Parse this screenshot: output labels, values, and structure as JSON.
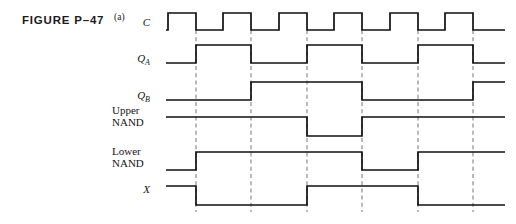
{
  "figure": {
    "caption": "FIGURE P–47",
    "part_label": "(a)"
  },
  "canvas": {
    "width": 516,
    "height": 224,
    "background": "#ffffff",
    "wave_color": "#101010",
    "guide_color": "#8d8d8d",
    "text_color": "#151515"
  },
  "timing": {
    "x_start": 166,
    "x_end": 505,
    "unit": 27.8,
    "guide_x": [
      196,
      251,
      307,
      362,
      418,
      473
    ],
    "clock_period_px": 55.6,
    "signal_count": 6
  },
  "signals": [
    {
      "name": "clock",
      "label": "C",
      "label_style": "italic",
      "subscript": "",
      "label_x": 150,
      "label_y": 26,
      "label_anchor": "end",
      "y_high": 13,
      "y_low": 30,
      "lead_in_x": 166,
      "transitions": [
        168,
        196,
        223,
        251,
        279,
        307,
        334,
        362,
        390,
        418,
        445,
        473
      ],
      "start_level": "low",
      "end_x": 505
    },
    {
      "name": "q-a",
      "label": "Q",
      "label_style": "italic",
      "subscript": "A",
      "label_x": 150,
      "label_y": 62,
      "label_anchor": "end",
      "y_high": 45,
      "y_low": 63,
      "lead_in_x": 166,
      "transitions": [
        196,
        251,
        307,
        362,
        418,
        473
      ],
      "start_level": "low",
      "end_x": 505
    },
    {
      "name": "q-b",
      "label": "Q",
      "label_style": "italic",
      "subscript": "B",
      "label_x": 150,
      "label_y": 99,
      "label_anchor": "end",
      "y_high": 82,
      "y_low": 100,
      "lead_in_x": 166,
      "transitions": [
        251,
        362,
        473
      ],
      "start_level": "low",
      "end_x": 505
    },
    {
      "name": "upper-nand",
      "label": "Upper",
      "label2": "NAND",
      "label_style": "roman",
      "subscript": "",
      "label_x": 112,
      "label_y": 114,
      "label2_y": 126,
      "label_anchor": "start",
      "y_high": 117,
      "y_low": 136,
      "lead_in_x": 166,
      "transitions": [
        307,
        362
      ],
      "start_level": "high",
      "end_x": 505
    },
    {
      "name": "lower-nand",
      "label": "Lower",
      "label2": "NAND",
      "label_style": "roman",
      "subscript": "",
      "label_x": 112,
      "label_y": 155,
      "label2_y": 167,
      "label_anchor": "start",
      "y_high": 152,
      "y_low": 170,
      "lead_in_x": 166,
      "transitions": [
        196,
        362,
        418
      ],
      "start_level": "low",
      "end_x": 505
    },
    {
      "name": "x-output",
      "label": "X",
      "label_style": "italic",
      "subscript": "",
      "label_x": 150,
      "label_y": 193,
      "label_anchor": "end",
      "y_high": 186,
      "y_low": 205,
      "lead_in_x": 166,
      "transitions": [
        196,
        307,
        418
      ],
      "start_level": "high",
      "end_x": 505
    }
  ],
  "guides": {
    "y_top": 30,
    "y_bottom": 212
  }
}
